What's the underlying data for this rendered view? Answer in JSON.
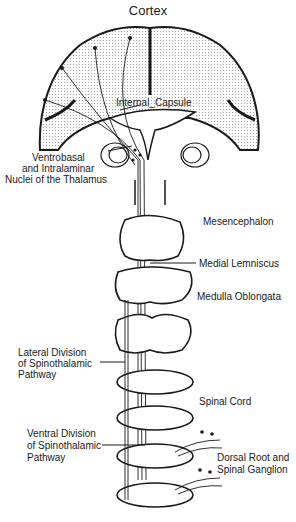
{
  "diagram": {
    "title": "Cortex",
    "labels": {
      "internal_capsule": "Internal_Capsule",
      "thalamus": [
        "Ventrobasal",
        "and Intralaminar",
        "Nuclei of the Thalamus"
      ],
      "mesencephalon": "Mesencephalon",
      "medial_lemniscus": "Medial Lemniscus",
      "medulla": "Medulla Oblongata",
      "lateral_division": [
        "Lateral Division",
        "of Spinothalamic",
        "Pathway"
      ],
      "spinal_cord": "Spinal Cord",
      "ventral_division": [
        "Ventral Division",
        "of Spinothalamic",
        "Pathway"
      ],
      "dorsal_root": [
        "Dorsal Root and",
        "Spinal Ganglion"
      ]
    },
    "colors": {
      "line": "#1a1a1a",
      "stipple": "#c8c8c8",
      "background": "#ffffff"
    }
  }
}
